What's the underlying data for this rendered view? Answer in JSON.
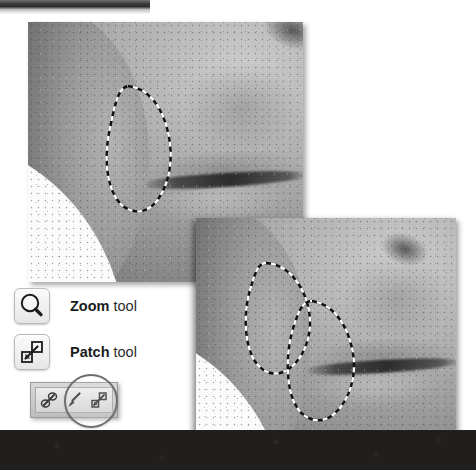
{
  "figure": {
    "background_color": "#ffffff",
    "top_strip": {
      "name": "cropped-panel-edge",
      "color": "#2c2c2c"
    },
    "bottom_band": {
      "name": "dark-background-band",
      "color": "#201f1e"
    }
  },
  "photos": [
    {
      "id": "photo-one",
      "alt": "Grayscale close-up of a face showing cheek and mouth with a dashed selection outline around a blemish",
      "selections": [
        {
          "name": "patch-selection-source",
          "shape": "freeform-ellipse"
        }
      ]
    },
    {
      "id": "photo-two",
      "alt": "Grayscale close-up of the same face with two dashed selection outlines showing the patch source and destination",
      "selections": [
        {
          "name": "patch-selection-source",
          "shape": "freeform-ellipse"
        },
        {
          "name": "patch-selection-destination",
          "shape": "freeform-ellipse"
        }
      ]
    }
  ],
  "legend": {
    "items": [
      {
        "icon": "zoom-tool-icon",
        "icon_glyph": "magnifying-glass",
        "name_bold": "Zoom",
        "name_rest": " tool"
      },
      {
        "icon": "patch-tool-icon",
        "icon_glyph": "two-overlapping-squares-with-arrow",
        "name_bold": "Patch",
        "name_rest": " tool"
      }
    ]
  },
  "flyout_toolbar": {
    "name": "healing-tools-flyout",
    "tools": [
      {
        "icon": "healing-brush-icon",
        "selected": false
      },
      {
        "icon": "brush-icon",
        "selected": false
      },
      {
        "icon": "patch-tool-icon",
        "selected": true
      }
    ],
    "highlight": {
      "name": "selection-highlight-ring",
      "color": "#6d6d6d"
    }
  }
}
